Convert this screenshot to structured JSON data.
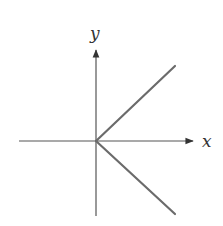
{
  "diagram": {
    "type": "coordinate-graph",
    "axes": {
      "x_label": "x",
      "y_label": "y"
    },
    "colors": {
      "axis": "#555555",
      "curve": "#6b6b6b",
      "label": "#333333",
      "background": "#ffffff"
    },
    "curves": [
      {
        "name": "upper-ray",
        "from": [
          0,
          0
        ],
        "direction": "up-right",
        "slope": 1
      },
      {
        "name": "lower-ray",
        "from": [
          0,
          0
        ],
        "direction": "down-right",
        "slope": -1
      }
    ]
  }
}
